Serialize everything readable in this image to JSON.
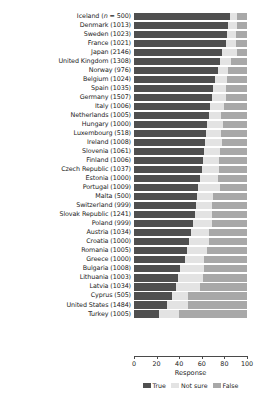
{
  "chart_data": {
    "type": "bar",
    "orientation": "horizontal",
    "stacked": true,
    "title": "",
    "xlabel": "Response",
    "ylabel": "",
    "xlim": [
      0,
      100
    ],
    "xticks": [
      0,
      20,
      40,
      60,
      80,
      100
    ],
    "grid": false,
    "legend_position": "bottom",
    "colors": {
      "True": "#4f4f4f",
      "Not sure": "#e3e3e3",
      "False": "#a8a8a8"
    },
    "series": [
      {
        "name": "True",
        "key": "true"
      },
      {
        "name": "Not sure",
        "key": "not_sure"
      },
      {
        "name": "False",
        "key": "false"
      }
    ],
    "categories": [
      "Iceland (n = 500)",
      "Denmark (1013)",
      "Sweden (1023)",
      "France (1021)",
      "Japan (2146)",
      "United Kingdom (1308)",
      "Norway (976)",
      "Belgium (1024)",
      "Spain (1035)",
      "Germany (1507)",
      "Italy (1006)",
      "Netherlands (1005)",
      "Hungary (1000)",
      "Luxembourg (518)",
      "Ireland (1008)",
      "Slovenia (1061)",
      "Finland (1006)",
      "Czech Republic (1037)",
      "Estonia (1000)",
      "Portugal (1009)",
      "Malta (500)",
      "Switzerland (999)",
      "Slovak Republic (1241)",
      "Poland (999)",
      "Austria (1034)",
      "Croatia (1000)",
      "Romania (1005)",
      "Greece (1000)",
      "Bulgaria (1008)",
      "Lithuania (1003)",
      "Latvia (1034)",
      "Cyprus (505)",
      "United States (1484)",
      "Turkey (1005)"
    ],
    "rows": [
      {
        "label": "Iceland (n = 500)",
        "label_prefix": "Iceland (",
        "label_italic": "n",
        "label_suffix": " = 500)",
        "true": 85,
        "not_sure": 6,
        "false": 9
      },
      {
        "label": "Denmark (1013)",
        "true": 83,
        "not_sure": 8,
        "false": 9
      },
      {
        "label": "Sweden (1023)",
        "true": 82,
        "not_sure": 8,
        "false": 10
      },
      {
        "label": "France (1021)",
        "true": 81,
        "not_sure": 9,
        "false": 10
      },
      {
        "label": "Japan (2146)",
        "true": 78,
        "not_sure": 13,
        "false": 9
      },
      {
        "label": "United Kingdom (1308)",
        "true": 76,
        "not_sure": 10,
        "false": 14
      },
      {
        "label": "Norway (976)",
        "true": 74,
        "not_sure": 9,
        "false": 17
      },
      {
        "label": "Belgium (1024)",
        "true": 72,
        "not_sure": 10,
        "false": 18
      },
      {
        "label": "Spain (1035)",
        "true": 70,
        "not_sure": 11,
        "false": 19
      },
      {
        "label": "Germany (1507)",
        "true": 69,
        "not_sure": 12,
        "false": 19
      },
      {
        "label": "Italy (1006)",
        "true": 67,
        "not_sure": 13,
        "false": 20
      },
      {
        "label": "Netherlands (1005)",
        "true": 66,
        "not_sure": 11,
        "false": 23
      },
      {
        "label": "Hungary (1000)",
        "true": 65,
        "not_sure": 14,
        "false": 21
      },
      {
        "label": "Luxembourg (518)",
        "true": 64,
        "not_sure": 13,
        "false": 23
      },
      {
        "label": "Ireland (1008)",
        "true": 63,
        "not_sure": 15,
        "false": 22
      },
      {
        "label": "Slovenia (1061)",
        "true": 62,
        "not_sure": 14,
        "false": 24
      },
      {
        "label": "Finland (1006)",
        "true": 61,
        "not_sure": 14,
        "false": 25
      },
      {
        "label": "Czech Republic (1037)",
        "true": 60,
        "not_sure": 15,
        "false": 25
      },
      {
        "label": "Estonia (1000)",
        "true": 58,
        "not_sure": 16,
        "false": 26
      },
      {
        "label": "Portugal (1009)",
        "true": 57,
        "not_sure": 19,
        "false": 24
      },
      {
        "label": "Malta (500)",
        "true": 56,
        "not_sure": 14,
        "false": 30
      },
      {
        "label": "Switzerland (999)",
        "true": 55,
        "not_sure": 14,
        "false": 31
      },
      {
        "label": "Slovak Republic (1241)",
        "true": 54,
        "not_sure": 15,
        "false": 31
      },
      {
        "label": "Poland (999)",
        "true": 52,
        "not_sure": 17,
        "false": 31
      },
      {
        "label": "Austria (1034)",
        "true": 50,
        "not_sure": 16,
        "false": 34
      },
      {
        "label": "Croatia (1000)",
        "true": 49,
        "not_sure": 17,
        "false": 34
      },
      {
        "label": "Romania (1005)",
        "true": 47,
        "not_sure": 18,
        "false": 35
      },
      {
        "label": "Greece (1000)",
        "true": 45,
        "not_sure": 17,
        "false": 38
      },
      {
        "label": "Bulgaria (1008)",
        "true": 41,
        "not_sure": 21,
        "false": 38
      },
      {
        "label": "Lithuania (1003)",
        "true": 39,
        "not_sure": 22,
        "false": 39
      },
      {
        "label": "Latvia (1034)",
        "true": 37,
        "not_sure": 21,
        "false": 42
      },
      {
        "label": "Cyprus (505)",
        "true": 34,
        "not_sure": 14,
        "false": 52
      },
      {
        "label": "United States (1484)",
        "true": 29,
        "not_sure": 19,
        "false": 52
      },
      {
        "label": "Turkey (1005)",
        "true": 22,
        "not_sure": 18,
        "false": 60
      }
    ]
  }
}
